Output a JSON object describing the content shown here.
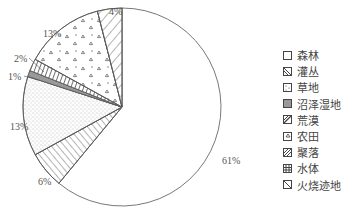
{
  "chart_data": {
    "type": "pie",
    "title": "",
    "categories": [
      "森林",
      "灌丛",
      "草地",
      "沼泽湿地",
      "荒漠",
      "农田",
      "聚落",
      "水体",
      "火烧迹地"
    ],
    "values": [
      61,
      6,
      13,
      1,
      2,
      13,
      0,
      0,
      4
    ],
    "slice_labels": [
      {
        "category": "森林",
        "label": "61%"
      },
      {
        "category": "灌丛",
        "label": "6%"
      },
      {
        "category": "草地",
        "label": "13%"
      },
      {
        "category": "沼泽湿地",
        "label": "1%"
      },
      {
        "category": "荒漠",
        "label": "2%"
      },
      {
        "category": "农田",
        "label": "13%"
      },
      {
        "category": "火烧迹地",
        "label": "4%"
      }
    ],
    "legend_position": "right",
    "start_angle": "top, clockwise"
  },
  "legend": {
    "items": [
      {
        "label": "森林",
        "pattern": "blank"
      },
      {
        "label": "灌丛",
        "pattern": "hatch-backslash"
      },
      {
        "label": "草地",
        "pattern": "sparse-dots"
      },
      {
        "label": "沼泽湿地",
        "pattern": "solid-gray"
      },
      {
        "label": "荒漠",
        "pattern": "hatch-slash"
      },
      {
        "label": "农田",
        "pattern": "triangles"
      },
      {
        "label": "聚落",
        "pattern": "hatch-slash-dense"
      },
      {
        "label": "水体",
        "pattern": "grid"
      },
      {
        "label": "火烧迹地",
        "pattern": "hatch-backslash-wide"
      }
    ]
  },
  "labels": {
    "forest": "61%",
    "shrub": "6%",
    "grass": "13%",
    "wetland": "1%",
    "desert": "2%",
    "farm": "13%",
    "burn": "4%"
  }
}
